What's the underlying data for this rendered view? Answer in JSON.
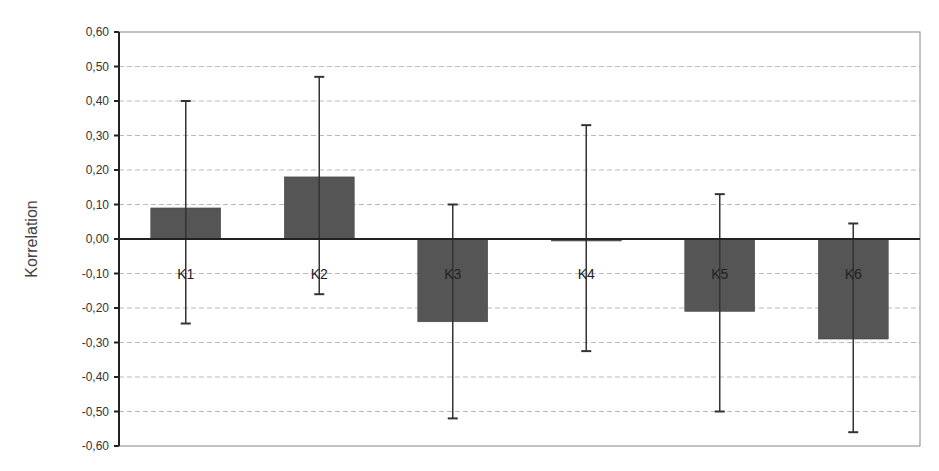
{
  "chart_data": {
    "type": "bar",
    "title": "",
    "xlabel": "",
    "ylabel": "Korrelation",
    "ylim": [
      -0.6,
      0.6
    ],
    "ytick_step": 0.1,
    "yticks": [
      "0,60",
      "0,50",
      "0,40",
      "0,30",
      "0,20",
      "0,10",
      "0,00",
      "-0,10",
      "-0,20",
      "-0,30",
      "-0,40",
      "-0,50",
      "-0,60"
    ],
    "grid": "horizontal-dashed",
    "legend": "none",
    "categories": [
      "K1",
      "K2",
      "K3",
      "K4",
      "K5",
      "K6"
    ],
    "values": [
      0.09,
      0.18,
      -0.24,
      -0.005,
      -0.21,
      -0.29
    ],
    "error_upper": [
      0.4,
      0.47,
      0.1,
      0.33,
      0.13,
      0.045
    ],
    "error_lower": [
      -0.245,
      -0.16,
      -0.52,
      -0.325,
      -0.5,
      -0.56
    ],
    "bar_color": "#555555",
    "category_labels_inside_plot": true
  }
}
